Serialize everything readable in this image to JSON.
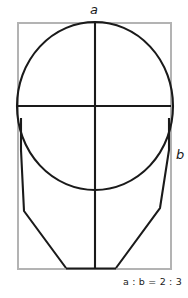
{
  "diagram": {
    "labels": {
      "width_label": "a",
      "height_label": "b",
      "ratio_text": "a : b = 2 : 3",
      "ratio_left_term": "a",
      "ratio_separator": " : ",
      "ratio_right_term": "b",
      "ratio_equals": " = ",
      "ratio_value": "2 : 3"
    },
    "colors": {
      "background": "#ffffff",
      "stroke": "#1a1a1a",
      "frame": "#b3b3b3",
      "text": "#1a1a1a"
    },
    "strokes": {
      "frame_width": 2,
      "outline_width": 2.1,
      "axis_width": 2.1
    },
    "geometry": {
      "frame": {
        "x": 18,
        "y": 23,
        "width": 153,
        "height": 246
      },
      "cranium_circle": {
        "cx": 95,
        "cy": 106,
        "rx": 78,
        "ry": 84
      },
      "vertical_axis": {
        "x": 95,
        "y1": 23,
        "y2": 269
      },
      "horizontal_axis": {
        "y": 106,
        "x1": 18,
        "x2": 171
      },
      "jaw_left_points": "21,118 21,150 24,211 66,268",
      "jaw_right_points": "169,118 169,150 160,208 116,268",
      "chin_line": {
        "x1": 66,
        "y1": 268.5,
        "x2": 116,
        "y2": 268.5
      }
    }
  }
}
